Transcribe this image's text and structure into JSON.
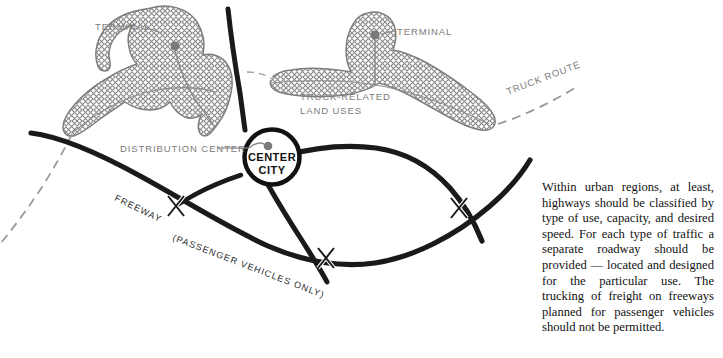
{
  "figure": {
    "type": "diagram"
  },
  "map": {
    "labels": {
      "terminal_left": "TERMINAL",
      "terminal_right": "TERMINAL",
      "truck_related_land_uses_line1": "TRUCK-RELATED",
      "truck_related_land_uses_line2": "LAND USES",
      "truck_route": "TRUCK ROUTE",
      "distribution_center": "DISTRIBUTION CENTER",
      "center_city_line1": "CENTER",
      "center_city_line2": "CITY",
      "freeway": "FREEWAY",
      "passenger_vehicles_only": "(PASSENGER VEHICLES ONLY)"
    },
    "colors": {
      "hatch": "#8a8a8a",
      "label": "#7c7c7c",
      "road": "#1a1a1a",
      "dashed_route": "#9a9a9a",
      "node_dot": "#7a7a7a",
      "background": "#ffffff"
    },
    "elements": {
      "hatched_zones": 2,
      "terminal_dots": 2,
      "center_city_node": "circle",
      "interchange_count": 3,
      "road_style": "heavy solid black curves",
      "truck_route_style": "grey dashed line"
    }
  },
  "caption": {
    "text": "Within urban regions, at least, highways should be classified by type of use, capacity, and desired speed. For each type of traffic a separate roadway should be provided — located and designed for the particular use. The trucking of freight on freeways planned for passenger vehicles should not be permitted."
  }
}
